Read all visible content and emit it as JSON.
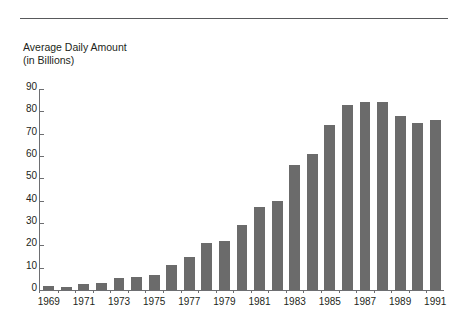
{
  "figure": {
    "title_lines": [
      "Average Daily Amount",
      "(in Billions)"
    ],
    "bar_color": "#6b6b6b",
    "axis_color": "#6d6e71",
    "text_color": "#231f20",
    "rule_color": "#58595b"
  },
  "chart_data": {
    "type": "bar",
    "title": "Average Daily Amount (in Billions)",
    "xlabel": "",
    "ylabel": "",
    "ylim": [
      0,
      90
    ],
    "yticks": [
      0,
      10,
      20,
      30,
      40,
      50,
      60,
      70,
      80,
      90
    ],
    "grid": false,
    "legend": "none",
    "label_every_n": 2,
    "categories": [
      "1969",
      "1970",
      "1971",
      "1972",
      "1973",
      "1974",
      "1975",
      "1976",
      "1977",
      "1978",
      "1979",
      "1980",
      "1981",
      "1982",
      "1983",
      "1984",
      "1985",
      "1986",
      "1987",
      "1988",
      "1989",
      "1990",
      "1991"
    ],
    "tick_labels": [
      "1969",
      "",
      "1971",
      "",
      "1973",
      "",
      "1975",
      "",
      "1977",
      "",
      "1979",
      "",
      "1981",
      "",
      "1983",
      "",
      "1985",
      "",
      "1987",
      "",
      "1989",
      "",
      "1991"
    ],
    "values": [
      2,
      1.5,
      2.5,
      3,
      5.5,
      6,
      6.5,
      11,
      15,
      21,
      22,
      29,
      37,
      40,
      56,
      61,
      74,
      83,
      84,
      84,
      78,
      75,
      76
    ]
  }
}
